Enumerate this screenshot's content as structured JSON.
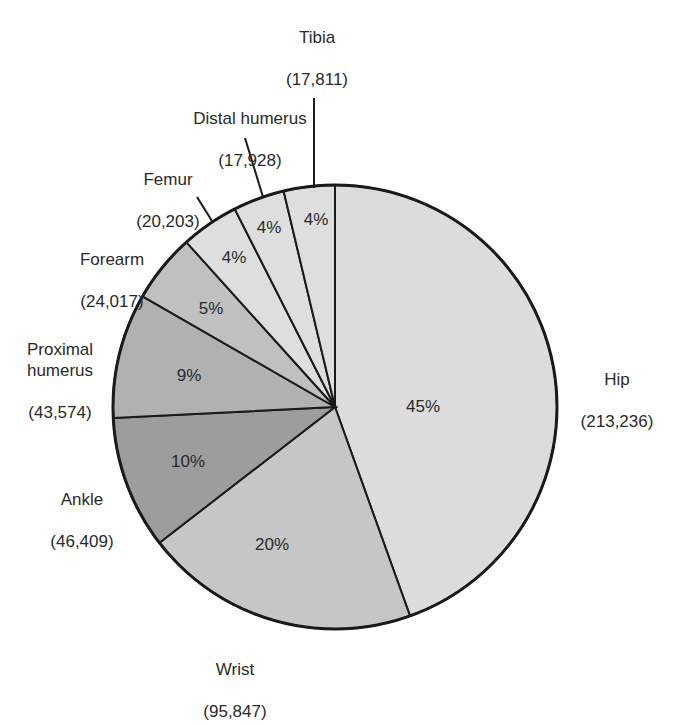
{
  "chart_data": {
    "type": "pie",
    "title": "",
    "categories": [
      "Hip",
      "Wrist",
      "Ankle",
      "Proximal humerus",
      "Forearm",
      "Femur",
      "Distal humerus",
      "Tibia"
    ],
    "values": [
      213236,
      95847,
      46409,
      43574,
      24017,
      20203,
      17928,
      17811
    ],
    "percent_labels": [
      "45%",
      "20%",
      "10%",
      "9%",
      "5%",
      "4%",
      "4%",
      "4%"
    ],
    "value_labels": [
      "(213,236)",
      "(95,847)",
      "(46,409)",
      "(43,574)",
      "(24,017)",
      "(20,203)",
      "(17,928)",
      "(17,811)"
    ],
    "colors": [
      "#dcdcdc",
      "#c6c6c6",
      "#9d9d9d",
      "#b1b1b1",
      "#c0c0c0",
      "#dedede",
      "#dedede",
      "#dedede"
    ],
    "legend": "none (direct labels)",
    "start_angle_deg": 0,
    "direction": "clockwise from 12 o'clock"
  },
  "labels": {
    "hip": {
      "name": "Hip",
      "value": "(213,236)",
      "pct": "45%"
    },
    "wrist": {
      "name": "Wrist",
      "value": "(95,847)",
      "pct": "20%"
    },
    "ankle": {
      "name": "Ankle",
      "value": "(46,409)",
      "pct": "10%"
    },
    "proximal_humerus": {
      "name": "Proximal\nhumerus",
      "value": "(43,574)",
      "pct": "9%"
    },
    "forearm": {
      "name": "Forearm",
      "value": "(24,017)",
      "pct": "5%"
    },
    "femur": {
      "name": "Femur",
      "value": "(20,203)",
      "pct": "4%"
    },
    "distal_humerus": {
      "name": "Distal humerus",
      "value": "(17,928)",
      "pct": "4%"
    },
    "tibia": {
      "name": "Tibia",
      "value": "(17,811)",
      "pct": "4%"
    }
  }
}
